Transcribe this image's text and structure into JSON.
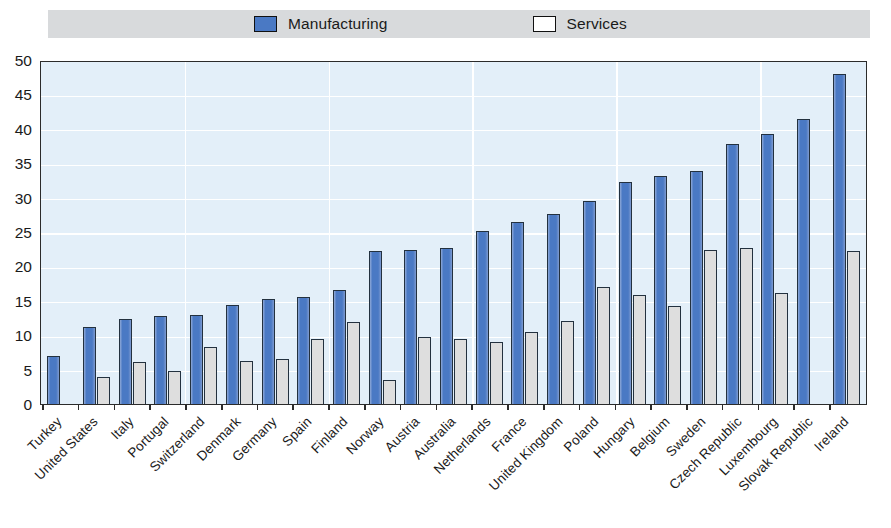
{
  "legend": {
    "entries": [
      {
        "label": "Manufacturing",
        "swatch": "filled-blue-square-icon",
        "color": "#4a79c4"
      },
      {
        "label": "Services",
        "swatch": "empty-white-square-icon",
        "color": "#ffffff"
      }
    ]
  },
  "axis": {
    "y_ticks": [
      "0",
      "5",
      "10",
      "15",
      "20",
      "25",
      "30",
      "35",
      "40",
      "45",
      "50"
    ]
  },
  "colors": {
    "manufacturing": "#4a79c4",
    "services": "#dedede",
    "plot_background": "#e3eff9",
    "gridline": "#ffffff",
    "legend_band": "#d8dadc",
    "axis_line": "#2b2b2b"
  },
  "chart_data": {
    "type": "bar",
    "title": "",
    "subtitle": "",
    "xlabel": "",
    "ylabel": "",
    "ylim": [
      0,
      50
    ],
    "ytick_step": 5,
    "grid": true,
    "legend_position": "top",
    "categories": [
      "Turkey",
      "United States",
      "Italy",
      "Portugal",
      "Switzerland",
      "Denmark",
      "Germany",
      "Spain",
      "Finland",
      "Norway",
      "Austria",
      "Australia",
      "Netherlands",
      "France",
      "United Kingdom",
      "Poland",
      "Hungary",
      "Belgium",
      "Sweden",
      "Czech Republic",
      "Luxembourg",
      "Slovak Republic",
      "Ireland"
    ],
    "series": [
      {
        "name": "Manufacturing",
        "color": "#4a79c4",
        "values": [
          7.0,
          11.2,
          12.4,
          12.8,
          13.0,
          14.4,
          15.2,
          15.6,
          16.6,
          22.3,
          22.4,
          22.7,
          25.1,
          26.4,
          27.6,
          29.5,
          32.3,
          33.1,
          33.8,
          37.8,
          39.3,
          41.4,
          48.0
        ]
      },
      {
        "name": "Services",
        "color": "#dedede",
        "values": [
          0.0,
          3.9,
          6.1,
          4.8,
          8.3,
          6.2,
          6.6,
          9.5,
          11.9,
          3.5,
          9.8,
          9.4,
          9.0,
          10.5,
          12.0,
          17.0,
          15.8,
          14.2,
          22.4,
          22.7,
          16.2,
          0.0,
          22.3
        ]
      }
    ]
  }
}
